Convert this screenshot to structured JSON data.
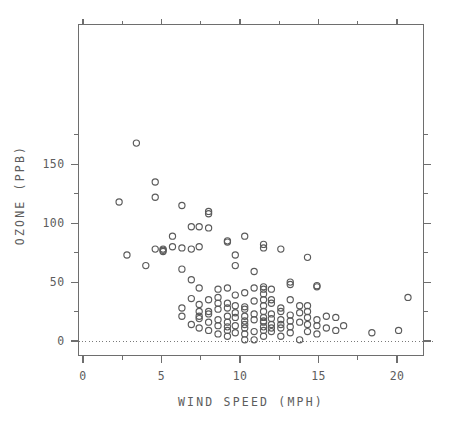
{
  "chart_data": {
    "type": "scatter",
    "title": "",
    "xlabel": "WIND SPEED (MPH)",
    "ylabel": "OZONE (PPB)",
    "xlim": [
      0,
      22
    ],
    "ylim": [
      0,
      180
    ],
    "grid": false,
    "legend": null,
    "marker": "open-circle",
    "reference_line": {
      "axis": "y",
      "value": 0,
      "style": "dotted"
    },
    "xticks_major": [
      0,
      5,
      10,
      15,
      20
    ],
    "xticks_major_labels": [
      "0",
      "5",
      "10",
      "15",
      "20"
    ],
    "xticks_minor": [
      2.5,
      7.5,
      12.5,
      17.5
    ],
    "yticks_major": [
      0,
      50,
      100,
      150
    ],
    "yticks_major_labels": [
      "0",
      "50",
      "100",
      "150"
    ],
    "yticks_minor": [
      25,
      75,
      125,
      175
    ],
    "points": [
      [
        3.4,
        168
      ],
      [
        4.6,
        135
      ],
      [
        4.6,
        122
      ],
      [
        2.3,
        118
      ],
      [
        6.3,
        115
      ],
      [
        8.0,
        110
      ],
      [
        8.0,
        108
      ],
      [
        6.9,
        97
      ],
      [
        7.4,
        97
      ],
      [
        8.0,
        96
      ],
      [
        5.7,
        89
      ],
      [
        10.3,
        89
      ],
      [
        9.2,
        85
      ],
      [
        9.2,
        84
      ],
      [
        11.5,
        82
      ],
      [
        11.5,
        79
      ],
      [
        12.6,
        78
      ],
      [
        5.1,
        78
      ],
      [
        5.1,
        77
      ],
      [
        5.1,
        76
      ],
      [
        9.7,
        73
      ],
      [
        2.8,
        73
      ],
      [
        14.3,
        71
      ],
      [
        4.0,
        64
      ],
      [
        9.7,
        64
      ],
      [
        6.3,
        61
      ],
      [
        10.9,
        59
      ],
      [
        6.9,
        52
      ],
      [
        13.2,
        50
      ],
      [
        13.2,
        48
      ],
      [
        14.9,
        47
      ],
      [
        14.9,
        46
      ],
      [
        7.4,
        45
      ],
      [
        11.5,
        44
      ],
      [
        12.0,
        44
      ],
      [
        10.3,
        41
      ],
      [
        11.5,
        40
      ],
      [
        9.7,
        39
      ],
      [
        8.6,
        37
      ],
      [
        20.7,
        37
      ],
      [
        6.9,
        36
      ],
      [
        8.0,
        35
      ],
      [
        10.9,
        34
      ],
      [
        12.0,
        32
      ],
      [
        9.2,
        32
      ],
      [
        7.4,
        31
      ],
      [
        11.5,
        30
      ],
      [
        14.3,
        30
      ],
      [
        10.3,
        29
      ],
      [
        12.6,
        28
      ],
      [
        6.3,
        28
      ],
      [
        8.6,
        27
      ],
      [
        9.7,
        24
      ],
      [
        13.8,
        24
      ],
      [
        8.0,
        23
      ],
      [
        12.0,
        23
      ],
      [
        13.2,
        22
      ],
      [
        9.2,
        21
      ],
      [
        10.3,
        21
      ],
      [
        11.5,
        20
      ],
      [
        9.7,
        20
      ],
      [
        14.3,
        20
      ],
      [
        16.1,
        20
      ],
      [
        7.4,
        19
      ],
      [
        8.6,
        18
      ],
      [
        10.9,
        18
      ],
      [
        12.6,
        18
      ],
      [
        14.9,
        18
      ],
      [
        8.0,
        16
      ],
      [
        9.2,
        16
      ],
      [
        11.5,
        16
      ],
      [
        13.8,
        16
      ],
      [
        6.9,
        14
      ],
      [
        10.3,
        14
      ],
      [
        12.0,
        14
      ],
      [
        14.3,
        14
      ],
      [
        16.6,
        13
      ],
      [
        8.6,
        13
      ],
      [
        9.7,
        13
      ],
      [
        11.5,
        12
      ],
      [
        13.2,
        12
      ],
      [
        7.4,
        11
      ],
      [
        10.3,
        11
      ],
      [
        12.6,
        11
      ],
      [
        15.5,
        11
      ],
      [
        8.0,
        9
      ],
      [
        9.2,
        9
      ],
      [
        11.5,
        9
      ],
      [
        20.1,
        9
      ],
      [
        10.9,
        8
      ],
      [
        12.0,
        8
      ],
      [
        14.3,
        8
      ],
      [
        18.4,
        7
      ],
      [
        9.7,
        7
      ],
      [
        13.2,
        7
      ],
      [
        10.3,
        6
      ],
      [
        8.6,
        6
      ],
      [
        14.9,
        6
      ],
      [
        9.2,
        4
      ],
      [
        11.5,
        4
      ],
      [
        12.6,
        4
      ],
      [
        10.3,
        1
      ],
      [
        13.8,
        1
      ],
      [
        10.9,
        1
      ],
      [
        5.7,
        80
      ],
      [
        6.3,
        79
      ],
      [
        7.4,
        80
      ],
      [
        6.9,
        78
      ],
      [
        4.6,
        78
      ],
      [
        8.6,
        44
      ],
      [
        9.2,
        45
      ],
      [
        10.9,
        45
      ],
      [
        11.5,
        46
      ],
      [
        12.0,
        35
      ],
      [
        13.2,
        35
      ],
      [
        7.4,
        25
      ],
      [
        8.0,
        25
      ],
      [
        9.2,
        28
      ],
      [
        10.3,
        27
      ],
      [
        11.5,
        25
      ],
      [
        12.6,
        25
      ],
      [
        14.3,
        25
      ],
      [
        13.8,
        30
      ],
      [
        15.5,
        21
      ],
      [
        6.3,
        21
      ],
      [
        7.4,
        21
      ],
      [
        12.0,
        19
      ],
      [
        10.9,
        23
      ],
      [
        9.7,
        30
      ],
      [
        8.6,
        32
      ],
      [
        11.5,
        35
      ],
      [
        12.6,
        14
      ],
      [
        14.9,
        13
      ],
      [
        16.1,
        9
      ],
      [
        9.2,
        12
      ],
      [
        10.3,
        17
      ],
      [
        11.5,
        17
      ],
      [
        12.0,
        11
      ],
      [
        13.2,
        17
      ]
    ]
  },
  "axes": {
    "x_title": "WIND SPEED (MPH)",
    "y_title": "OZONE (PPB)"
  }
}
